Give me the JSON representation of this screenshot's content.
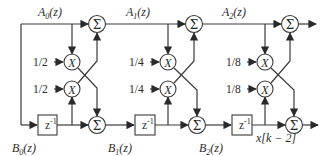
{
  "diagram": {
    "type": "lattice-filter-signal-flow",
    "stages": [
      {
        "top_label": {
          "base": "A",
          "sub": "0",
          "arg": "(z)"
        },
        "bottom_label": {
          "base": "B",
          "sub": "0",
          "arg": "(z)"
        },
        "coef_upper": "1/2",
        "coef_lower": "1/2",
        "delay_label": "z",
        "delay_exp": "-1"
      },
      {
        "top_label": {
          "base": "A",
          "sub": "1",
          "arg": "(z)"
        },
        "bottom_label": {
          "base": "B",
          "sub": "1",
          "arg": "(z)"
        },
        "coef_upper": "1/4",
        "coef_lower": "1/4",
        "delay_label": "z",
        "delay_exp": "-1"
      },
      {
        "top_label": {
          "base": "A",
          "sub": "2",
          "arg": "(z)"
        },
        "bottom_label": {
          "base": "B",
          "sub": "2",
          "arg": "(z)"
        },
        "coef_upper": "1/8",
        "coef_lower": "1/8",
        "delay_label": "z",
        "delay_exp": "-1"
      }
    ],
    "multiplier_symbol": "X",
    "adder_symbol": "Σ",
    "delay_output_label": "x[k − 2]"
  }
}
